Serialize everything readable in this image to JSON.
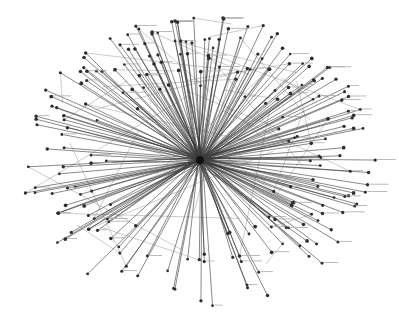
{
  "diagram": {
    "type": "radial-network",
    "hub": {
      "x": 200,
      "y": 160,
      "label": ""
    },
    "colors": {
      "edge": "#3a3a3a",
      "node": "#2e2e2e",
      "background": "#ffffff",
      "label": "#888888"
    },
    "seed": 7,
    "spoke_count": 230,
    "cross_edge_count": 40,
    "node_labels_legible": false
  }
}
